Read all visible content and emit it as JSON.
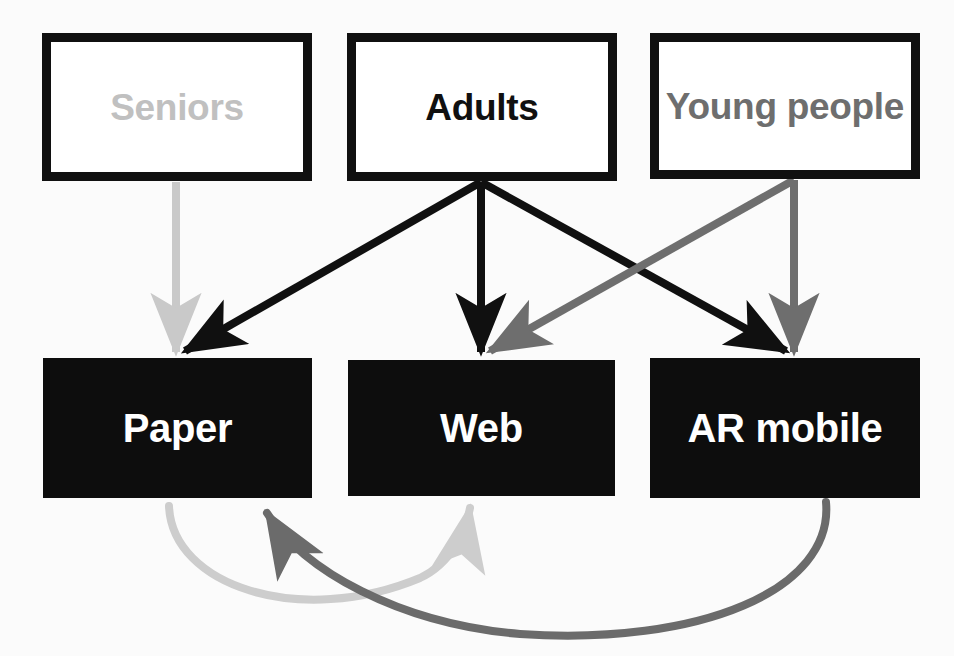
{
  "diagram": {
    "type": "flow-diagram",
    "background_color": "#fbfbfb",
    "nodes": [
      {
        "id": "seniors",
        "label": "Seniors",
        "role": "user-group",
        "text_color": "#c0c0c0",
        "fill": "#ffffff",
        "border_color": "#101010",
        "x": 42,
        "y": 33,
        "w": 270,
        "h": 148
      },
      {
        "id": "adults",
        "label": "Adults",
        "role": "user-group",
        "text_color": "#101010",
        "fill": "#ffffff",
        "border_color": "#101010",
        "x": 347,
        "y": 33,
        "w": 270,
        "h": 148
      },
      {
        "id": "young-people",
        "label": "Young people",
        "role": "user-group",
        "text_color": "#6e6e6e",
        "fill": "#ffffff",
        "border_color": "#101010",
        "x": 650,
        "y": 33,
        "w": 270,
        "h": 146
      },
      {
        "id": "paper",
        "label": "Paper",
        "role": "medium",
        "text_color": "#ffffff",
        "fill": "#0d0d0d",
        "x": 43,
        "y": 358,
        "w": 269,
        "h": 140
      },
      {
        "id": "web",
        "label": "Web",
        "role": "medium",
        "text_color": "#ffffff",
        "fill": "#0d0d0d",
        "x": 348,
        "y": 360,
        "w": 267,
        "h": 136
      },
      {
        "id": "ar-mobile",
        "label": "AR mobile",
        "role": "medium",
        "text_color": "#ffffff",
        "fill": "#0d0d0d",
        "x": 650,
        "y": 358,
        "w": 270,
        "h": 140
      }
    ],
    "edges": [
      {
        "id": "seniors-to-paper",
        "from": "seniors",
        "to": "paper",
        "color": "#c9c9c9",
        "style": "straight"
      },
      {
        "id": "adults-to-paper",
        "from": "adults",
        "to": "paper",
        "color": "#101010",
        "style": "straight"
      },
      {
        "id": "adults-to-web",
        "from": "adults",
        "to": "web",
        "color": "#101010",
        "style": "straight"
      },
      {
        "id": "adults-to-ar-mobile",
        "from": "adults",
        "to": "ar-mobile",
        "color": "#101010",
        "style": "straight"
      },
      {
        "id": "young-to-web",
        "from": "young-people",
        "to": "web",
        "color": "#6e6e6e",
        "style": "straight"
      },
      {
        "id": "young-to-ar-mobile",
        "from": "young-people",
        "to": "ar-mobile",
        "color": "#6e6e6e",
        "style": "straight"
      },
      {
        "id": "paper-to-web",
        "from": "paper",
        "to": "web",
        "color": "#cdcdcd",
        "style": "curved"
      },
      {
        "id": "ar-mobile-to-paper",
        "from": "ar-mobile",
        "to": "paper",
        "color": "#6b6b6b",
        "style": "curved"
      }
    ]
  }
}
